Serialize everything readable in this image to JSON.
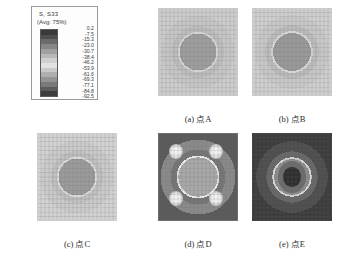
{
  "figure": {
    "kind": "fea-contour-figure",
    "background": "#ffffff"
  },
  "legend": {
    "name": "contour-legend",
    "title": "S, S33",
    "subtitle": "(Avg: 75%)",
    "values": [
      "0.2",
      "-7.5",
      "-15.3",
      "-23.0",
      "-30.7",
      "-38.4",
      "-46.2",
      "-53.9",
      "-61.6",
      "-69.3",
      "-77.1",
      "-84.8",
      "-92.5"
    ],
    "swatches": [
      "#3a3a3a",
      "#4e4e4e",
      "#6a6a6a",
      "#868686",
      "#a0a0a0",
      "#b8b8b8",
      "#cfcfcf",
      "#e2e2e2",
      "#c9c9c9",
      "#aeaeae",
      "#949494",
      "#7a7a7a",
      "#5c5c5c",
      "#3d3d3d"
    ]
  },
  "panels": [
    {
      "id": "a",
      "name": "panel-point-a",
      "caption": "(a) 点A",
      "matrix_color": "#c6c6c6",
      "halo_color": "#bdbdbd",
      "inclusion_color": "#9e9e9e",
      "ring_color": "#d7d7d7",
      "corner_color": "#cdcdcd",
      "frame_color": "#c9c9c9",
      "has_bullseye": false,
      "inclusion_radius_pct": 31
    },
    {
      "id": "b",
      "name": "panel-point-b",
      "caption": "(b) 点B",
      "matrix_color": "#c8c8c8",
      "halo_color": "#bcbcbc",
      "inclusion_color": "#9a9a9a",
      "ring_color": "#dadada",
      "corner_color": "#cfcfcf",
      "frame_color": "#cbcbcb",
      "has_bullseye": false,
      "inclusion_radius_pct": 32
    },
    {
      "id": "c",
      "name": "panel-point-c",
      "caption": "(c) 点C",
      "matrix_color": "#cacaca",
      "halo_color": "#c0c0c0",
      "inclusion_color": "#9b9b9b",
      "ring_color": "#dcdcdc",
      "corner_color": "#d2d2d2",
      "frame_color": "#cccccc",
      "has_bullseye": false,
      "inclusion_radius_pct": 31
    },
    {
      "id": "d",
      "name": "panel-point-d",
      "caption": "(d) 点D",
      "matrix_color": "#8a8a8a",
      "halo_color": "#767676",
      "inclusion_color": "#a8a8a8",
      "ring_color": "#ececec",
      "corner_color": "#5a5a5a",
      "frame_color": "#6e6e6e",
      "has_bullseye": false,
      "inclusion_radius_pct": 33
    },
    {
      "id": "e",
      "name": "panel-point-e",
      "caption": "(e) 点E",
      "matrix_color": "#4e4e4e",
      "halo_color": "#686868",
      "inclusion_color": "#8e8e8e",
      "ring_color": "#d8d8d8",
      "corner_color": "#3c3c3c",
      "frame_color": "#454545",
      "has_bullseye": true,
      "bullseye_core_color": "#2e2e2e",
      "bullseye_mid_color": "#6c6c6c",
      "inclusion_radius_pct": 30
    }
  ]
}
